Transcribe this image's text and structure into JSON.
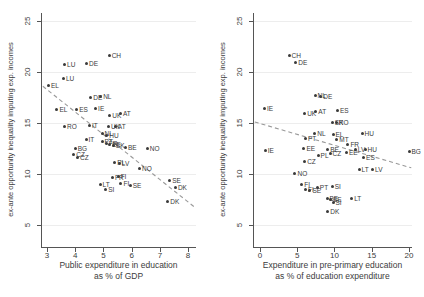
{
  "figure": {
    "y_axis_title": "ex-ante opportunity inequality imputing exp. incomes",
    "marker_color": "#3a3a3a",
    "label_color": "#3a3a3a",
    "axis_color": "#555555",
    "trend_color": "#999999",
    "background_color": "#ffffff"
  },
  "chart_data": [
    {
      "type": "scatter",
      "panel": "left",
      "ylabel": "ex-ante opportunity inequality imputing exp. incomes",
      "xlabel": "Public expenditure in education as % of GDP",
      "xlabel_lines": [
        "Public expenditure in education",
        "as % of GDP"
      ],
      "xlim": [
        2.82,
        8.28
      ],
      "ylim": [
        2.84,
        25.78
      ],
      "xticks": [
        3,
        4,
        5,
        6,
        7,
        8
      ],
      "yticks": [
        5,
        10,
        15,
        20,
        25
      ],
      "grid": "faint-horizontal",
      "legend": "none",
      "trend": {
        "style": "dashed",
        "x1": 2.85,
        "y1": 18.6,
        "x2": 8.25,
        "y2": 6.7
      },
      "points": [
        {
          "label": "CH",
          "x": 5.2,
          "y": 21.6
        },
        {
          "label": "DE",
          "x": 4.4,
          "y": 20.8
        },
        {
          "label": "LU",
          "x": 3.62,
          "y": 20.7
        },
        {
          "label": "LU",
          "x": 3.58,
          "y": 19.4
        },
        {
          "label": "EL",
          "x": 3.05,
          "y": 18.7
        },
        {
          "label": "DE",
          "x": 4.55,
          "y": 17.5
        },
        {
          "label": "NL",
          "x": 4.9,
          "y": 17.6
        },
        {
          "label": "EL",
          "x": 3.35,
          "y": 16.3
        },
        {
          "label": "ES",
          "x": 4.05,
          "y": 16.3
        },
        {
          "label": "IE",
          "x": 4.72,
          "y": 16.4
        },
        {
          "label": "UK",
          "x": 5.22,
          "y": 15.7
        },
        {
          "label": "AT",
          "x": 5.6,
          "y": 15.9
        },
        {
          "label": "RO",
          "x": 3.62,
          "y": 14.7
        },
        {
          "label": "IT",
          "x": 4.5,
          "y": 14.8
        },
        {
          "label": "UK",
          "x": 5.18,
          "y": 14.7
        },
        {
          "label": "AT",
          "x": 5.42,
          "y": 14.7
        },
        {
          "label": "NL",
          "x": 4.95,
          "y": 14.0
        },
        {
          "label": "HU",
          "x": 5.12,
          "y": 13.8
        },
        {
          "label": "IT",
          "x": 4.38,
          "y": 13.4
        },
        {
          "label": "PT",
          "x": 4.95,
          "y": 13.2
        },
        {
          "label": "FR",
          "x": 5.1,
          "y": 13.0
        },
        {
          "label": "EE",
          "x": 5.22,
          "y": 12.9
        },
        {
          "label": "SK",
          "x": 5.35,
          "y": 12.8
        },
        {
          "label": "BG",
          "x": 4.0,
          "y": 12.5
        },
        {
          "label": "BE",
          "x": 5.78,
          "y": 12.6
        },
        {
          "label": "NO",
          "x": 6.55,
          "y": 12.5
        },
        {
          "label": "CZ",
          "x": 3.95,
          "y": 11.9
        },
        {
          "label": "CZ",
          "x": 4.08,
          "y": 11.6
        },
        {
          "label": "PL",
          "x": 5.4,
          "y": 11.1
        },
        {
          "label": "LV",
          "x": 5.56,
          "y": 11.0
        },
        {
          "label": "NO",
          "x": 6.28,
          "y": 10.5
        },
        {
          "label": "FR",
          "x": 5.32,
          "y": 9.7
        },
        {
          "label": "FI",
          "x": 5.52,
          "y": 9.8
        },
        {
          "label": "FI",
          "x": 5.62,
          "y": 9.1
        },
        {
          "label": "SE",
          "x": 5.95,
          "y": 8.9
        },
        {
          "label": "LT",
          "x": 4.88,
          "y": 9.0
        },
        {
          "label": "SI",
          "x": 5.08,
          "y": 8.5
        },
        {
          "label": "SE",
          "x": 7.35,
          "y": 9.4
        },
        {
          "label": "DK",
          "x": 7.55,
          "y": 8.7
        },
        {
          "label": "DK",
          "x": 7.28,
          "y": 7.3
        }
      ]
    },
    {
      "type": "scatter",
      "panel": "right",
      "ylabel": "ex-ante opportunity inequality imputing exp. incomes",
      "xlabel": "Expenditure in pre-primary education as % of education expenditure",
      "xlabel_lines": [
        "Expenditure in pre-primary education",
        "as % of education expenditure"
      ],
      "xlim": [
        -0.8,
        20.4
      ],
      "ylim": [
        2.84,
        25.78
      ],
      "xticks": [
        0,
        5,
        10,
        15,
        20
      ],
      "yticks": [
        5,
        10,
        15,
        20,
        25
      ],
      "grid": "faint-horizontal",
      "legend": "none",
      "trend": {
        "style": "dashed",
        "x1": -0.7,
        "y1": 15.1,
        "x2": 20.3,
        "y2": 10.6
      },
      "points": [
        {
          "label": "CH",
          "x": 3.9,
          "y": 21.6
        },
        {
          "label": "DE",
          "x": 4.8,
          "y": 20.9
        },
        {
          "label": "NL",
          "x": 7.4,
          "y": 17.7
        },
        {
          "label": "DE",
          "x": 8.15,
          "y": 17.6
        },
        {
          "label": "IE",
          "x": 0.6,
          "y": 16.4
        },
        {
          "label": "UK",
          "x": 6.0,
          "y": 15.9
        },
        {
          "label": "AT",
          "x": 7.5,
          "y": 16.1
        },
        {
          "label": "ES",
          "x": 10.4,
          "y": 16.2
        },
        {
          "label": "SK",
          "x": 9.7,
          "y": 15.0
        },
        {
          "label": "RO",
          "x": 10.25,
          "y": 15.0
        },
        {
          "label": "NL",
          "x": 7.35,
          "y": 14.0
        },
        {
          "label": "EL",
          "x": 9.8,
          "y": 13.9
        },
        {
          "label": "HU",
          "x": 13.7,
          "y": 14.0
        },
        {
          "label": "PT",
          "x": 6.1,
          "y": 13.5
        },
        {
          "label": "MT",
          "x": 10.3,
          "y": 13.4
        },
        {
          "label": "FR",
          "x": 11.8,
          "y": 12.9
        },
        {
          "label": "IE",
          "x": 0.7,
          "y": 12.3
        },
        {
          "label": "EE",
          "x": 5.9,
          "y": 12.5
        },
        {
          "label": "BE",
          "x": 9.1,
          "y": 12.4
        },
        {
          "label": "LV",
          "x": 12.8,
          "y": 12.4
        },
        {
          "label": "HU",
          "x": 14.1,
          "y": 12.4
        },
        {
          "label": "BG",
          "x": 20.0,
          "y": 12.2
        },
        {
          "label": "PL",
          "x": 7.8,
          "y": 11.8
        },
        {
          "label": "CZ",
          "x": 9.4,
          "y": 12.0
        },
        {
          "label": "EE",
          "x": 11.6,
          "y": 12.1
        },
        {
          "label": "ES",
          "x": 13.9,
          "y": 11.6
        },
        {
          "label": "CZ",
          "x": 6.0,
          "y": 11.2
        },
        {
          "label": "LT",
          "x": 13.3,
          "y": 10.4
        },
        {
          "label": "LV",
          "x": 15.1,
          "y": 10.4
        },
        {
          "label": "NO",
          "x": 4.7,
          "y": 10.0
        },
        {
          "label": "FI",
          "x": 5.6,
          "y": 9.0
        },
        {
          "label": "FI",
          "x": 6.1,
          "y": 8.5
        },
        {
          "label": "SE",
          "x": 6.7,
          "y": 8.4
        },
        {
          "label": "PT",
          "x": 7.7,
          "y": 8.7
        },
        {
          "label": "SI",
          "x": 9.7,
          "y": 8.8
        },
        {
          "label": "BE",
          "x": 9.0,
          "y": 7.6
        },
        {
          "label": "SE",
          "x": 9.45,
          "y": 7.5
        },
        {
          "label": "SI",
          "x": 9.8,
          "y": 7.2
        },
        {
          "label": "LT",
          "x": 12.3,
          "y": 7.6
        },
        {
          "label": "DK",
          "x": 9.1,
          "y": 6.3
        }
      ]
    }
  ]
}
